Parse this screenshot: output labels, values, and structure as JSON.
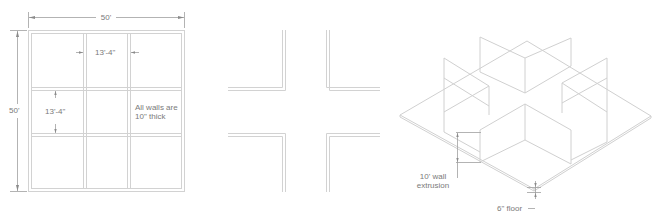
{
  "colors": {
    "wall_line": "#cfcfcf",
    "dim_line": "#9a9a9a",
    "text": "#7a7a7a",
    "background": "#ffffff"
  },
  "panels": {
    "plan": {
      "title": "Floor plan with dimensions",
      "dim_overall_width": "50'",
      "dim_overall_height": "50'",
      "dim_room_width": "13'-4\"",
      "dim_room_height": "13'-4\"",
      "note_line1": "All walls are",
      "note_line2": "10\" thick"
    },
    "corners": {
      "title": "Corner wall segments"
    },
    "isometric": {
      "title": "Isometric extrusion",
      "wall_label_line1": "10' wall",
      "wall_label_line2": "extrusion",
      "floor_label": "6\" floor"
    }
  }
}
